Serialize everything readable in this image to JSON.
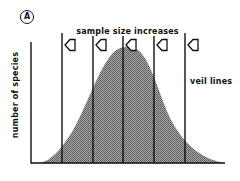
{
  "figure": {
    "panel_label": "A",
    "title": "sample size increases",
    "y_axis_label": "number of species",
    "veil_label": "veil lines",
    "colors": {
      "ink": "#111111",
      "fill": "#8c8c8c",
      "background": "#ffffff"
    },
    "veil_lines": [
      {
        "id": 1,
        "x": 62
      },
      {
        "id": 2,
        "x": 93
      },
      {
        "id": 3,
        "x": 123
      },
      {
        "id": 4,
        "x": 154
      },
      {
        "id": 5,
        "x": 185
      }
    ],
    "arrow_direction": "left",
    "curve": "bell-shaped distribution (lognormal species abundance)"
  }
}
